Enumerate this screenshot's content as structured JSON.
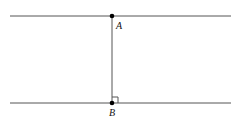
{
  "diagram": {
    "type": "geometry",
    "colors": {
      "line": "#555555",
      "point": "#000000",
      "label": "#111111",
      "background": "#ffffff"
    },
    "lines": [
      {
        "id": "top-line",
        "x1": 10,
        "y1": 16,
        "x2": 231,
        "y2": 16
      },
      {
        "id": "bottom-line",
        "x1": 10,
        "y1": 103,
        "x2": 231,
        "y2": 103
      },
      {
        "id": "segment-AB",
        "x1": 112,
        "y1": 16,
        "x2": 112,
        "y2": 103
      }
    ],
    "points": [
      {
        "id": "A",
        "label": "A",
        "x": 112,
        "y": 16,
        "label_x": 116,
        "label_y": 29
      },
      {
        "id": "B",
        "label": "B",
        "x": 112,
        "y": 103,
        "label_x": 109,
        "label_y": 116
      }
    ],
    "right_angle_marker": {
      "at": "B",
      "x": 112,
      "y": 97,
      "size": 6
    }
  }
}
